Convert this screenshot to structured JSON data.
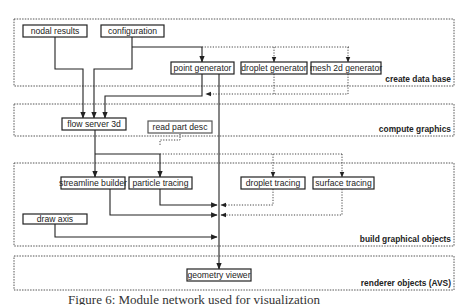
{
  "groups": [
    {
      "id": "create-data-base",
      "label": "create data base"
    },
    {
      "id": "compute-graphics",
      "label": "compute graphics"
    },
    {
      "id": "build-graphical-objects",
      "label": "build graphical objects"
    },
    {
      "id": "renderer-objects",
      "label": "renderer objects (AVS)"
    }
  ],
  "modules": {
    "nodal_results": "nodal results",
    "configuration": "configuration",
    "point_generator": "point generator",
    "droplet_generator": "droplet generator",
    "mesh_2d_generator": "mesh 2d generator",
    "flow_server_3d": "flow server 3d",
    "read_part_desc": "read part desc",
    "streamline_builder": "streamline builder",
    "particle_tracing": "particle tracing",
    "droplet_tracing": "droplet tracing",
    "surface_tracing": "surface tracing",
    "draw_axis": "draw axis",
    "geometry_viewer": "geometry viewer"
  },
  "connections": [
    {
      "from": "configuration",
      "to": "point_generator",
      "style": "solid"
    },
    {
      "from": "configuration",
      "to": "droplet_generator",
      "style": "dotted"
    },
    {
      "from": "configuration",
      "to": "mesh_2d_generator",
      "style": "dotted"
    },
    {
      "from": "nodal_results",
      "to": "flow_server_3d",
      "style": "solid"
    },
    {
      "from": "configuration",
      "to": "flow_server_3d",
      "style": "solid"
    },
    {
      "from": "point_generator",
      "to": "flow_server_3d",
      "style": "solid"
    },
    {
      "from": "droplet_generator",
      "to": "flow_server_3d",
      "style": "dotted"
    },
    {
      "from": "mesh_2d_generator",
      "to": "flow_server_3d",
      "style": "dotted"
    },
    {
      "from": "point_generator",
      "to": "geometry_viewer",
      "style": "solid"
    },
    {
      "from": "flow_server_3d",
      "to": "streamline_builder",
      "style": "solid"
    },
    {
      "from": "flow_server_3d",
      "to": "particle_tracing",
      "style": "solid"
    },
    {
      "from": "read_part_desc",
      "to": "particle_tracing",
      "style": "dotted"
    },
    {
      "from": "flow_server_3d",
      "to": "droplet_tracing",
      "style": "dotted"
    },
    {
      "from": "flow_server_3d",
      "to": "surface_tracing",
      "style": "dotted"
    },
    {
      "from": "particle_tracing",
      "to": "geometry_viewer",
      "style": "solid"
    },
    {
      "from": "droplet_tracing",
      "to": "geometry_viewer",
      "style": "dotted"
    },
    {
      "from": "streamline_builder",
      "to": "geometry_viewer",
      "style": "solid"
    },
    {
      "from": "surface_tracing",
      "to": "geometry_viewer",
      "style": "dotted"
    },
    {
      "from": "draw_axis",
      "to": "geometry_viewer",
      "style": "solid"
    }
  ],
  "caption": "Figure 6: Module network used for visualization"
}
